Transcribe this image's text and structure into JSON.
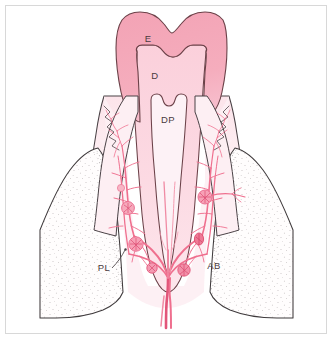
{
  "figure": {
    "type": "anatomical-diagram",
    "frame_color": "#d8d8d8",
    "background_color": "#ffffff"
  },
  "labels": [
    {
      "key": "enamel",
      "text": "E",
      "meaning": "Enamel",
      "x": 148,
      "y": 42
    },
    {
      "key": "dentin",
      "text": "D",
      "meaning": "Dentin",
      "x": 155,
      "y": 79
    },
    {
      "key": "dental_pulp",
      "text": "DP",
      "meaning": "Dental pulp",
      "x": 162,
      "y": 123
    },
    {
      "key": "periodontal_ligament",
      "text": "PL",
      "meaning": "Periodontal ligament",
      "x": 104,
      "y": 271
    },
    {
      "key": "alveolar_bone",
      "text": "AB",
      "meaning": "Alveolar bone",
      "x": 214,
      "y": 269
    }
  ],
  "colors": {
    "enamel": "#f3a5b6",
    "enamel_outline": "#6b4148",
    "dentin": "#fbd2dc",
    "dentin_outline": "#6b4148",
    "pulp": "#fdf2f6",
    "pulp_outline": "#6b4148",
    "gingiva": "#fdeff3",
    "gingiva_outline": "#4a4246",
    "bone_fill": "#fffdfd",
    "bone_outline": "#3f3a3c",
    "bone_stipple": "#6d6466",
    "vessel": "#ef6f8e",
    "vessel_dark": "#e25579",
    "vessel_light": "#f59bb0",
    "label_text": "#4a3a3e"
  },
  "structures": [
    {
      "key": "enamel",
      "name": "Enamel crown layer",
      "label": "E"
    },
    {
      "key": "dentin",
      "name": "Dentin layer",
      "label": "D"
    },
    {
      "key": "pulp",
      "name": "Dental pulp chamber and root canal",
      "label": "DP"
    },
    {
      "key": "gingiva",
      "name": "Gingiva (gum) with epithelial attachment",
      "label": ""
    },
    {
      "key": "alveolar-bone-left",
      "name": "Alveolar bone left",
      "label": "AB"
    },
    {
      "key": "alveolar-bone-right",
      "name": "Alveolar bone right",
      "label": "AB"
    },
    {
      "key": "periodontal-ligament",
      "name": "Periodontal ligament space",
      "label": "PL"
    },
    {
      "key": "vascular-network",
      "name": "Periodontal and pulpal vascular plexus",
      "label": ""
    },
    {
      "key": "apical-bundle",
      "name": "Apical neurovascular bundle",
      "label": ""
    }
  ]
}
